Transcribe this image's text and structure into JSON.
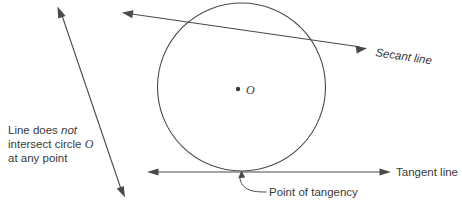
{
  "diagram": {
    "background_color": "#ffffff",
    "ink_color": "#4a4a4a",
    "text_color": "#3a3a3a"
  },
  "circle": {
    "center_label": "O",
    "center_x": 241.5,
    "center_y": 87,
    "radius": 84,
    "center_dot_label": "center-dot"
  },
  "labels": {
    "secant": "Secant line",
    "tangent": "Tangent line",
    "point_of_tangency": "Point of tangency",
    "nonintersecting_line_1": "Line does ",
    "nonintersecting_line_1_emphasis": "not",
    "nonintersecting_line_2": "intersect circle ",
    "nonintersecting_line_2_circle": "O",
    "nonintersecting_line_3": "at any point"
  },
  "lines": {
    "secant": {
      "name": "secant-line",
      "x1": 124,
      "y1": 13,
      "x2": 366,
      "y2": 48,
      "arrow_start": true,
      "arrow_end": true
    },
    "tangent": {
      "name": "tangent-line",
      "x1": 148,
      "y1": 172,
      "x2": 390,
      "y2": 172,
      "arrow_start": true,
      "arrow_end": true
    },
    "external": {
      "name": "non-intersecting-line",
      "x1": 57,
      "y1": 8,
      "x2": 125,
      "y2": 196,
      "arrow_start": true,
      "arrow_end": true
    }
  },
  "tangency_point": {
    "x": 241.5,
    "y": 171
  }
}
